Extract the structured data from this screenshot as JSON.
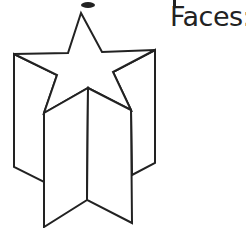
{
  "label": {
    "faces": "Faces:"
  },
  "figure": {
    "stroke_color": "#222222",
    "fill_color": "#ffffff"
  }
}
